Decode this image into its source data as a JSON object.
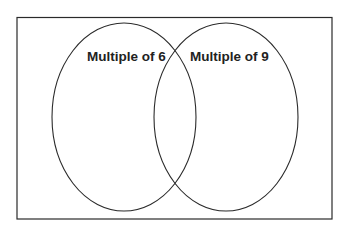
{
  "diagram": {
    "type": "venn",
    "universe": {
      "x": 17,
      "y": 17,
      "width": 315,
      "height": 202
    },
    "sets": [
      {
        "label": "Multiple of 6",
        "cx": 124,
        "cy": 117,
        "rx": 72,
        "ry": 94
      },
      {
        "label": "Multiple of 9",
        "cx": 226,
        "cy": 117,
        "rx": 72,
        "ry": 94
      }
    ],
    "colors": {
      "stroke": "#2a2a2a",
      "text": "#222222",
      "background": "#ffffff"
    }
  }
}
